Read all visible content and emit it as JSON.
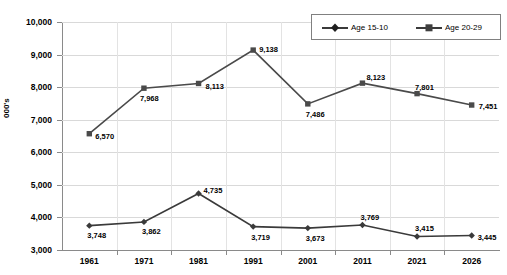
{
  "chart_data": {
    "type": "line",
    "title": "",
    "xlabel": "",
    "ylabel": "000's",
    "categories": [
      "1961",
      "1971",
      "1981",
      "1991",
      "2001",
      "2011",
      "2021",
      "2026"
    ],
    "ylim": [
      3000,
      10000
    ],
    "ytick_labels": [
      "10,000",
      "9,000",
      "8,000",
      "7,000",
      "6,000",
      "5,000",
      "4,000",
      "3,000"
    ],
    "ytick_values": [
      10000,
      9000,
      8000,
      7000,
      6000,
      5000,
      4000,
      3000
    ],
    "grid": true,
    "legend_position": "top-right",
    "series": [
      {
        "name": "Age 15-10",
        "marker": "diamond",
        "color": "#3a3a3a",
        "values": [
          3748,
          3862,
          4735,
          3719,
          3673,
          3769,
          3415,
          3445
        ],
        "labels": [
          "3,748",
          "3,862",
          "4,735",
          "3,719",
          "3,673",
          "3,769",
          "3,415",
          "3,445"
        ]
      },
      {
        "name": "Age 20-29",
        "marker": "square",
        "color": "#4a4a4a",
        "values": [
          6570,
          7968,
          8113,
          9138,
          7486,
          8123,
          7801,
          7451
        ],
        "labels": [
          "6,570",
          "7,968",
          "8,113",
          "9,138",
          "7,486",
          "8,123",
          "7,801",
          "7,451"
        ]
      }
    ]
  },
  "legend": {
    "items": [
      {
        "label": "Age 15-10"
      },
      {
        "label": "Age 20-29"
      }
    ]
  }
}
